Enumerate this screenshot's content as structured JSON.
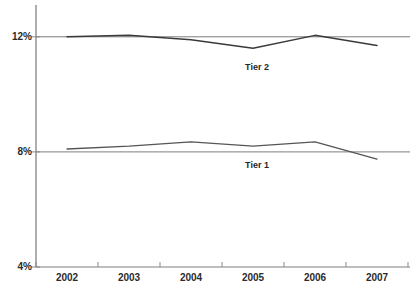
{
  "chart_data": {
    "type": "line",
    "title": "",
    "subtitle": "",
    "xlabel": "",
    "ylabel": "",
    "categories": [
      "2002",
      "2003",
      "2004",
      "2005",
      "2006",
      "2007"
    ],
    "ylim": [
      4,
      12
    ],
    "ytick_labels": [
      "12%",
      "8%",
      "4%"
    ],
    "ytick_values": [
      12,
      8,
      4
    ],
    "grid": "horizontal",
    "legend": "inline-labels",
    "series": [
      {
        "name": "Tier 2",
        "values": [
          12.0,
          12.05,
          11.9,
          11.6,
          12.05,
          11.7
        ],
        "color": "#3a3a3a",
        "label_text": "Tier 2"
      },
      {
        "name": "Tier 1",
        "values": [
          8.1,
          8.2,
          8.35,
          8.2,
          8.35,
          7.75
        ],
        "color": "#555555",
        "label_text": "Tier 1"
      }
    ],
    "axis_color": "#8a8a8a",
    "gridline_color": "#7d7d7d",
    "background_color": "#ffffff"
  },
  "axes": {
    "y_labels": {
      "top": "12%",
      "middle": "8%",
      "bottom": "4%"
    },
    "x_labels": {
      "y0": "2002",
      "y1": "2003",
      "y2": "2004",
      "y3": "2005",
      "y4": "2006",
      "y5": "2007"
    }
  },
  "series_labels": {
    "tier2": "Tier 2",
    "tier1": "Tier 1"
  }
}
